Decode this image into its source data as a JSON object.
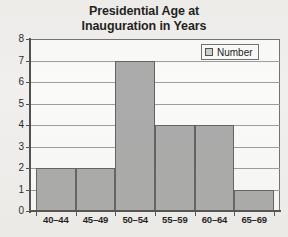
{
  "chart_data": {
    "type": "bar",
    "title": "Presidential Age at Inauguration in Years",
    "title_lines": [
      "Presidential Age at",
      "Inauguration in Years"
    ],
    "categories": [
      "40–44",
      "45–49",
      "50–54",
      "55–59",
      "60–64",
      "65–69"
    ],
    "values": [
      2,
      2,
      7,
      4,
      4,
      1
    ],
    "series": [
      {
        "name": "Number",
        "values": [
          2,
          2,
          7,
          4,
          4,
          1
        ]
      }
    ],
    "xlabel": "",
    "ylabel": "",
    "ylim": [
      0,
      8
    ],
    "ytick_labels": [
      "8",
      "7",
      "6",
      "5",
      "4",
      "3",
      "2",
      "1",
      "0"
    ],
    "ytick_values": [
      8,
      7,
      6,
      5,
      4,
      3,
      2,
      1,
      0
    ],
    "grid": true,
    "legend": {
      "position": "top-right",
      "entries": [
        {
          "label": "Number",
          "swatch_color": "#cfcfcf"
        }
      ]
    },
    "colors": {
      "bar_fill": "#a9a9a9",
      "bar_border": "#5d5d5d",
      "gridline": "#9a9a9a",
      "axis": "#4a4a4a",
      "plot_background": "#fcfcfb",
      "page_background": "#f2f1ef",
      "text": "#111111"
    }
  }
}
